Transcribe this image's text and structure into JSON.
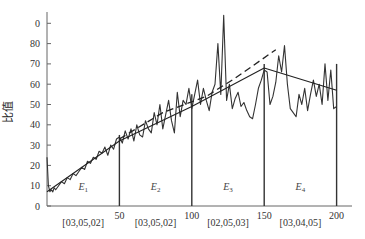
{
  "chart_data": {
    "type": "line",
    "title": "",
    "xlabel": "",
    "ylabel": "比值",
    "xlim": [
      0,
      210
    ],
    "ylim": [
      0,
      95
    ],
    "y_ticks": [
      "0",
      "10",
      "20",
      "30",
      "40",
      "50",
      "60",
      "70",
      "80",
      "0"
    ],
    "x_ticks": [
      "50",
      "100",
      "150",
      "200"
    ],
    "segment_boundaries": [
      50,
      100,
      150,
      200
    ],
    "segments": [
      {
        "name": "E",
        "sub": "1",
        "range": [
          0,
          50
        ],
        "code": "[03,05,02]"
      },
      {
        "name": "E",
        "sub": "2",
        "range": [
          50,
          100
        ],
        "code": "[03,05,02]"
      },
      {
        "name": "E",
        "sub": "3",
        "range": [
          100,
          150
        ],
        "code": "[02,05,03]"
      },
      {
        "name": "E",
        "sub": "4",
        "range": [
          150,
          200
        ],
        "code": "[03,04,05]"
      }
    ],
    "grid": false,
    "legend": null,
    "series": [
      {
        "name": "ratio",
        "style": "solid-noisy",
        "x": [
          0,
          1,
          2,
          3,
          4,
          5,
          6,
          8,
          10,
          12,
          14,
          16,
          18,
          20,
          22,
          24,
          26,
          28,
          30,
          32,
          34,
          36,
          38,
          40,
          42,
          44,
          46,
          48,
          50,
          52,
          54,
          56,
          58,
          60,
          62,
          64,
          66,
          68,
          70,
          72,
          74,
          76,
          78,
          80,
          82,
          84,
          86,
          88,
          90,
          92,
          94,
          96,
          98,
          100,
          102,
          104,
          106,
          108,
          110,
          112,
          114,
          116,
          118,
          120,
          122,
          124,
          126,
          128,
          130,
          132,
          134,
          136,
          138,
          140,
          142,
          144,
          146,
          148,
          150,
          152,
          154,
          156,
          158,
          160,
          162,
          164,
          166,
          168,
          170,
          172,
          174,
          176,
          178,
          180,
          182,
          184,
          186,
          188,
          190,
          192,
          194,
          196,
          198,
          200
        ],
        "values": [
          24,
          10,
          7,
          8,
          7,
          9,
          8,
          10,
          12,
          11,
          14,
          13,
          16,
          15,
          17,
          19,
          18,
          22,
          21,
          24,
          23,
          27,
          26,
          29,
          25,
          30,
          28,
          33,
          34,
          31,
          37,
          33,
          38,
          32,
          40,
          35,
          34,
          42,
          38,
          36,
          46,
          40,
          50,
          38,
          45,
          52,
          42,
          36,
          56,
          44,
          52,
          50,
          58,
          48,
          55,
          62,
          50,
          58,
          52,
          47,
          56,
          60,
          80,
          55,
          94,
          52,
          60,
          48,
          53,
          56,
          49,
          51,
          47,
          44,
          43,
          50,
          58,
          62,
          67,
          66,
          50,
          54,
          61,
          74,
          66,
          79,
          60,
          48,
          46,
          44,
          55,
          50,
          58,
          47,
          55,
          62,
          54,
          60,
          50,
          70,
          52,
          67,
          48,
          49
        ]
      },
      {
        "name": "piecewise-fit",
        "style": "solid",
        "x": [
          0,
          50,
          100,
          150,
          200
        ],
        "values": [
          7,
          32,
          49,
          68,
          57
        ]
      },
      {
        "name": "trend",
        "style": "dashed",
        "x": [
          50,
          80,
          110,
          130,
          158
        ],
        "values": [
          33,
          46,
          54,
          63,
          77
        ]
      }
    ]
  },
  "labels": {
    "ylabel": "比值"
  }
}
